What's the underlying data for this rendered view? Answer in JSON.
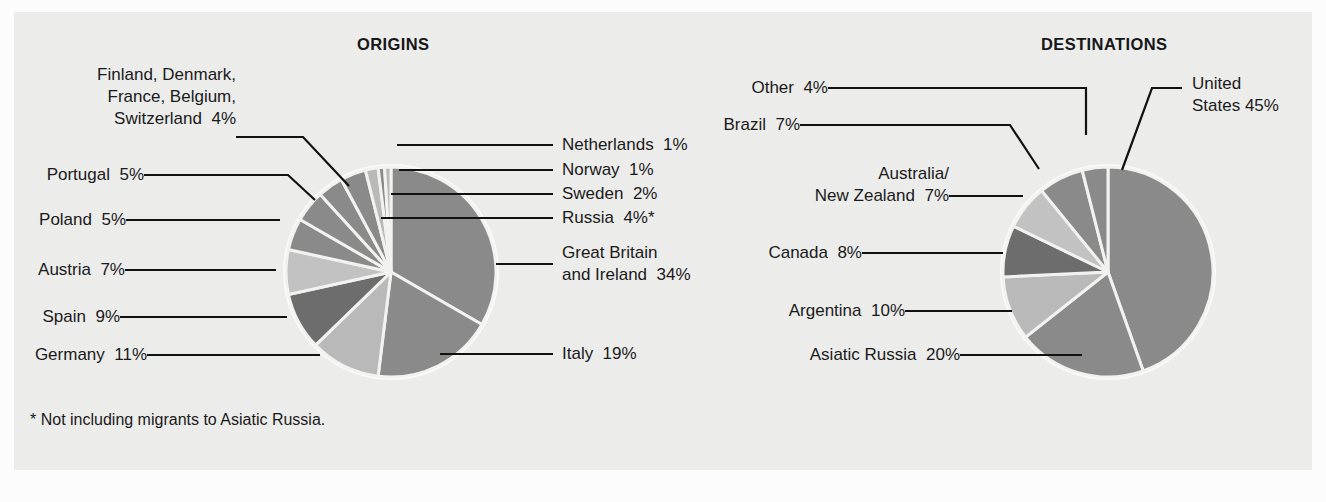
{
  "figure": {
    "background_color": "#fcfcfc",
    "panel_color": "#ececeb",
    "text_color": "#1a1a1a",
    "leader_color": "#111111",
    "slice_gap_color": "#f2f2f0"
  },
  "origins": {
    "title": "ORIGINS",
    "footnote": "* Not including migrants to Asiatic Russia.",
    "labels": {
      "nordic_group": "Finland, Denmark,\nFrance, Belgium,\nSwitzerland  4%",
      "portugal": "Portugal  5%",
      "poland": "Poland  5%",
      "austria": "Austria  7%",
      "spain": "Spain  9%",
      "germany": "Germany  11%",
      "netherlands": "Netherlands  1%",
      "norway": "Norway  1%",
      "sweden": "Sweden  2%",
      "russia": "Russia  4%*",
      "great_britain": "Great Britain\nand Ireland  34%",
      "italy": "Italy  19%"
    }
  },
  "destinations": {
    "title": "DESTINATIONS",
    "labels": {
      "other": "Other  4%",
      "brazil": "Brazil  7%",
      "australia_nz": "Australia/\nNew Zealand  7%",
      "canada": "Canada  8%",
      "argentina": "Argentina  10%",
      "asiatic_russia": "Asiatic Russia  20%",
      "united_states": "United\nStates 45%"
    }
  },
  "chart_data": [
    {
      "type": "pie",
      "title": "ORIGINS",
      "id": "origins",
      "unit": "percent",
      "note": "* Not including migrants to Asiatic Russia.",
      "legend": "callout-labels",
      "center": [
        391,
        272
      ],
      "radius": 105,
      "start_angle_deg": -90,
      "direction": "clockwise",
      "categories": [
        "Great Britain and Ireland",
        "Italy",
        "Germany",
        "Spain",
        "Austria",
        "Poland",
        "Portugal",
        "Finland, Denmark, France, Belgium, Switzerland",
        "Russia",
        "Sweden",
        "Norway",
        "Netherlands"
      ],
      "values": [
        34,
        19,
        11,
        9,
        7,
        5,
        5,
        4,
        4,
        2,
        1,
        1
      ],
      "colors": [
        "#8a8a8a",
        "#8a8a8a",
        "#b9b9b9",
        "#6d6d6d",
        "#c2c2c2",
        "#8a8a8a",
        "#8a8a8a",
        "#8a8a8a",
        "#8a8a8a",
        "#b9b9b9",
        "#8a8a8a",
        "#b9b9b9"
      ]
    },
    {
      "type": "pie",
      "title": "DESTINATIONS",
      "id": "destinations",
      "unit": "percent",
      "legend": "callout-labels",
      "center": [
        1108,
        272
      ],
      "radius": 105,
      "start_angle_deg": -90,
      "direction": "clockwise",
      "categories": [
        "United States",
        "Asiatic Russia",
        "Argentina",
        "Canada",
        "Australia/New Zealand",
        "Brazil",
        "Other"
      ],
      "values": [
        45,
        20,
        10,
        8,
        7,
        7,
        4
      ],
      "colors": [
        "#8a8a8a",
        "#8a8a8a",
        "#b9b9b9",
        "#6d6d6d",
        "#c2c2c2",
        "#8a8a8a",
        "#8a8a8a"
      ]
    }
  ]
}
